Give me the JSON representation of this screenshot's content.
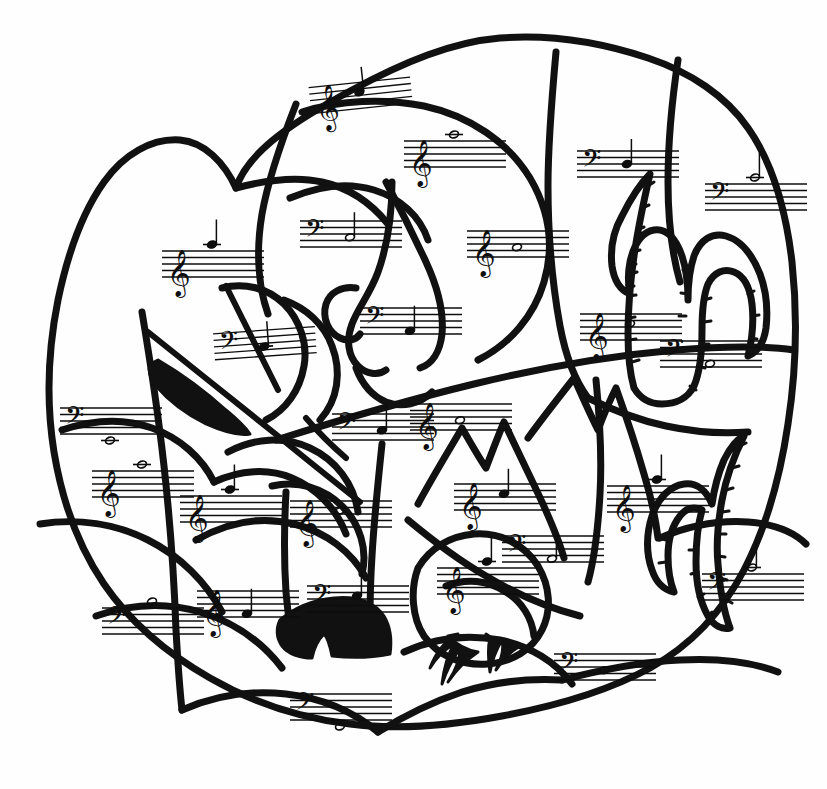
{
  "document": {
    "title": "Music Note Coloring Worksheet",
    "kind": "hand-drawn black-and-white line-art coloring page",
    "scene_description": "Irregular rounded blob outline divided into many puzzle-like regions depicting a desert landscape with saguaro cacti, a bird on a nest, trees, mountains and an arrow; each region contains a music staff with a clef and one note",
    "background_color": "#fefefe",
    "ink_color": "#0d0d0d",
    "width": 827,
    "height": 789
  },
  "scene": {
    "shapes": [
      {
        "name": "outer-blob-outline",
        "label": "Outer blob outline"
      },
      {
        "name": "cactus-large-center-right",
        "label": "Large saguaro cactus with spines"
      },
      {
        "name": "cactus-right-edge",
        "label": "Right-edge saguaro cactus with spines"
      },
      {
        "name": "bird-on-nest",
        "label": "Bird sitting on a nest"
      },
      {
        "name": "tree-with-dark-trunk",
        "label": "Tree with solid black trunk"
      },
      {
        "name": "arrow-feathered",
        "label": "Feathered arrow crossing the left region"
      },
      {
        "name": "mountain-peaks",
        "label": "Jagged mountain peaks"
      },
      {
        "name": "profile-face",
        "label": "Drawn profile face / rock formation"
      }
    ]
  },
  "staves": [
    {
      "id": "s01",
      "clef": "treble",
      "clef_glyph": "𝄞",
      "note": "quarter-note",
      "note_glyph": "♩",
      "pitch_position": "space-3",
      "ledger": "none",
      "x": 305,
      "y": 72,
      "scale": 1.0,
      "rot": -6
    },
    {
      "id": "s02",
      "clef": "treble",
      "clef_glyph": "𝄞",
      "note": "whole-note",
      "note_glyph": "𝅝",
      "pitch_position": "above-staff",
      "ledger": "above-1",
      "x": 402,
      "y": 125,
      "scale": 1.0,
      "rot": 0
    },
    {
      "id": "s03",
      "clef": "bass",
      "clef_glyph": "𝄢",
      "note": "half-note",
      "note_glyph": "𝅗𝅥",
      "pitch_position": "space-2",
      "ledger": "none",
      "x": 298,
      "y": 205,
      "scale": 1.0,
      "rot": 0
    },
    {
      "id": "s04",
      "clef": "treble",
      "clef_glyph": "𝄞",
      "note": "quarter-note",
      "note_glyph": "♩",
      "pitch_position": "above-staff",
      "ledger": "above-1",
      "x": 160,
      "y": 235,
      "scale": 1.0,
      "rot": 0
    },
    {
      "id": "s05",
      "clef": "treble",
      "clef_glyph": "𝄞",
      "note": "whole-note",
      "note_glyph": "𝅝",
      "pitch_position": "space-2",
      "ledger": "none",
      "x": 465,
      "y": 215,
      "scale": 1.0,
      "rot": 0
    },
    {
      "id": "s06",
      "clef": "bass",
      "clef_glyph": "𝄢",
      "note": "quarter-note",
      "note_glyph": "♩",
      "pitch_position": "line-3",
      "ledger": "none",
      "x": 575,
      "y": 135,
      "scale": 1.0,
      "rot": 0
    },
    {
      "id": "s07",
      "clef": "bass",
      "clef_glyph": "𝄢",
      "note": "half-note",
      "note_glyph": "𝅗𝅥",
      "pitch_position": "above-staff",
      "ledger": "above-1",
      "x": 703,
      "y": 168,
      "scale": 1.0,
      "rot": 0
    },
    {
      "id": "s08",
      "clef": "bass",
      "clef_glyph": "𝄢",
      "note": "quarter-note",
      "note_glyph": "♩",
      "pitch_position": "space-2",
      "ledger": "below-1",
      "x": 210,
      "y": 318,
      "scale": 1.0,
      "rot": -4
    },
    {
      "id": "s09",
      "clef": "bass",
      "clef_glyph": "𝄢",
      "note": "quarter-note",
      "note_glyph": "♩",
      "pitch_position": "space-1",
      "ledger": "none",
      "x": 358,
      "y": 292,
      "scale": 1.0,
      "rot": 0
    },
    {
      "id": "s10",
      "clef": "treble",
      "clef_glyph": "𝄞",
      "note": "whole-note",
      "note_glyph": "𝅝",
      "pitch_position": "space-3",
      "ledger": "none",
      "x": 578,
      "y": 298,
      "scale": 1.0,
      "rot": 0
    },
    {
      "id": "s11",
      "clef": "bass",
      "clef_glyph": "𝄢",
      "note": "whole-note",
      "note_glyph": "𝅝",
      "pitch_position": "space-1",
      "ledger": "none",
      "x": 658,
      "y": 325,
      "scale": 1.0,
      "rot": 0
    },
    {
      "id": "s12",
      "clef": "bass",
      "clef_glyph": "𝄢",
      "note": "whole-note",
      "note_glyph": "𝅝",
      "pitch_position": "below-staff",
      "ledger": "below-1",
      "x": 58,
      "y": 392,
      "scale": 1.0,
      "rot": 0
    },
    {
      "id": "s13",
      "clef": "bass",
      "clef_glyph": "𝄢",
      "note": "quarter-note",
      "note_glyph": "♩",
      "pitch_position": "space-2",
      "ledger": "none",
      "x": 330,
      "y": 398,
      "scale": 1.0,
      "rot": 0
    },
    {
      "id": "s14",
      "clef": "treble",
      "clef_glyph": "𝄞",
      "note": "whole-note",
      "note_glyph": "𝅝",
      "pitch_position": "space-2",
      "ledger": "none",
      "x": 408,
      "y": 388,
      "scale": 1.0,
      "rot": 0
    },
    {
      "id": "s15",
      "clef": "treble",
      "clef_glyph": "𝄞",
      "note": "whole-note",
      "note_glyph": "𝅝",
      "pitch_position": "above-staff",
      "ledger": "above-1",
      "x": 90,
      "y": 455,
      "scale": 1.0,
      "rot": 0
    },
    {
      "id": "s16",
      "clef": "treble",
      "clef_glyph": "𝄞",
      "note": "quarter-note",
      "note_glyph": "♩",
      "pitch_position": "above-staff",
      "ledger": "above-1",
      "x": 178,
      "y": 480,
      "scale": 1.0,
      "rot": 0
    },
    {
      "id": "s17",
      "clef": "treble",
      "clef_glyph": "𝄞",
      "note": "whole-note",
      "note_glyph": "𝅝",
      "pitch_position": "space-3",
      "ledger": "none",
      "x": 288,
      "y": 485,
      "scale": 1.0,
      "rot": 0
    },
    {
      "id": "s18",
      "clef": "treble",
      "clef_glyph": "𝄞",
      "note": "quarter-note",
      "note_glyph": "♩",
      "pitch_position": "space-3",
      "ledger": "none",
      "x": 452,
      "y": 468,
      "scale": 1.0,
      "rot": 0
    },
    {
      "id": "s19",
      "clef": "bass",
      "clef_glyph": "𝄢",
      "note": "half-note",
      "note_glyph": "𝅗𝅥",
      "pitch_position": "space-1",
      "ledger": "none",
      "x": 500,
      "y": 520,
      "scale": 1.0,
      "rot": 0
    },
    {
      "id": "s20",
      "clef": "treble",
      "clef_glyph": "𝄞",
      "note": "quarter-note",
      "note_glyph": "♩",
      "pitch_position": "above-staff",
      "ledger": "above-1",
      "x": 605,
      "y": 470,
      "scale": 1.0,
      "rot": 0
    },
    {
      "id": "s21",
      "clef": "treble",
      "clef_glyph": "𝄞",
      "note": "quarter-note",
      "note_glyph": "♩",
      "pitch_position": "above-staff",
      "ledger": "above-1",
      "x": 435,
      "y": 552,
      "scale": 1.0,
      "rot": 0
    },
    {
      "id": "s22",
      "clef": "bass",
      "clef_glyph": "𝄢",
      "note": "half-note",
      "note_glyph": "𝅗𝅥",
      "pitch_position": "above-staff",
      "ledger": "above-1",
      "x": 700,
      "y": 558,
      "scale": 1.0,
      "rot": 0
    },
    {
      "id": "s23",
      "clef": "bass",
      "clef_glyph": "𝄢",
      "note": "whole-note",
      "note_glyph": "𝅝",
      "pitch_position": "above-staff",
      "ledger": "none",
      "x": 100,
      "y": 592,
      "scale": 1.0,
      "rot": 0
    },
    {
      "id": "s24",
      "clef": "treble",
      "clef_glyph": "𝄞",
      "note": "quarter-note",
      "note_glyph": "♩",
      "pitch_position": "space-1",
      "ledger": "none",
      "x": 195,
      "y": 575,
      "scale": 1.0,
      "rot": 0
    },
    {
      "id": "s25",
      "clef": "bass",
      "clef_glyph": "𝄢",
      "note": "quarter-note",
      "note_glyph": "♩",
      "pitch_position": "space-3",
      "ledger": "none",
      "x": 305,
      "y": 570,
      "scale": 1.0,
      "rot": 0
    },
    {
      "id": "s26",
      "clef": "bass",
      "clef_glyph": "𝄢",
      "note": "whole-note",
      "note_glyph": "𝅝",
      "pitch_position": "space-2",
      "ledger": "none",
      "x": 552,
      "y": 638,
      "scale": 1.0,
      "rot": 0
    },
    {
      "id": "s27",
      "clef": "bass",
      "clef_glyph": "𝄢",
      "note": "whole-note",
      "note_glyph": "𝅝",
      "pitch_position": "below-staff",
      "ledger": "none",
      "x": 288,
      "y": 678,
      "scale": 1.0,
      "rot": 0
    }
  ]
}
